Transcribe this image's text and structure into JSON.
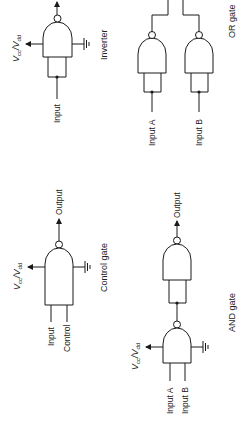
{
  "diagram": {
    "orientation": "rotated 90° counter-clockwise",
    "gates": {
      "inverter": {
        "caption": "Inverter",
        "supply": {
          "main": "V",
          "sub1": "cc",
          "mid": "/V",
          "sub2": "dd"
        },
        "inputs": [
          "Input"
        ]
      },
      "or_gate": {
        "caption": "OR gate",
        "inputs": [
          "Input A",
          "Input B"
        ]
      },
      "control_gate": {
        "caption": "Control gate",
        "supply": {
          "main": "V",
          "sub1": "cc",
          "mid": "/V",
          "sub2": "dd"
        },
        "inputs": [
          "Input",
          "Control"
        ],
        "output": "Output"
      },
      "and_gate": {
        "caption": "AND gate",
        "supply": {
          "main": "V",
          "sub1": "cc",
          "mid": "/V",
          "sub2": "dd"
        },
        "inputs": [
          "Input A",
          "Input B"
        ],
        "output": "Output"
      }
    },
    "colors": {
      "ink": "#1a1a1a",
      "background": "#ffffff"
    }
  }
}
